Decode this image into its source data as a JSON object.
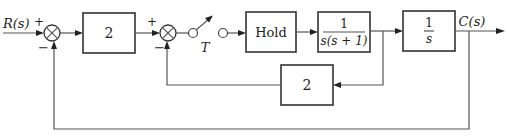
{
  "diagram": {
    "type": "block-diagram",
    "input_label": "R(s)",
    "output_label": "C(s)",
    "summing_junctions": [
      {
        "id": "sum1",
        "plus_sign": "+",
        "minus_sign": "−"
      },
      {
        "id": "sum2",
        "plus_sign": "+",
        "minus_sign": "−"
      }
    ],
    "sampler": {
      "label": "T"
    },
    "blocks": {
      "gain_forward": {
        "label": "2"
      },
      "hold": {
        "label": "Hold"
      },
      "plant1": {
        "numerator": "1",
        "denominator": "s(s + 1)"
      },
      "integrator": {
        "numerator": "1",
        "denominator": "s"
      },
      "gain_feedback": {
        "label": "2"
      }
    },
    "connections": [
      "R(s) → sum1(+)",
      "sum1 → gain 2",
      "gain 2 → sum2(+)",
      "sum2 → sampler T",
      "sampler T → Hold",
      "Hold → 1/(s(s+1))",
      "1/(s(s+1)) → 1/s",
      "1/s → C(s)",
      "1/(s(s+1)) output → feedback gain 2 → sum2(−)",
      "C(s) → sum1(−)"
    ]
  }
}
